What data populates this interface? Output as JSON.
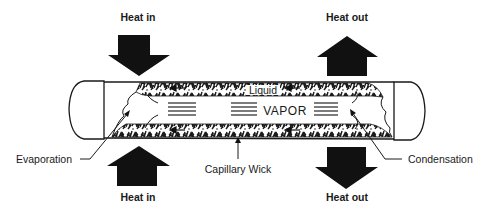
{
  "diagram": {
    "type": "heat-pipe",
    "labels": {
      "heat_in_top": "Heat in",
      "heat_out_top": "Heat out",
      "heat_in_bottom": "Heat in",
      "heat_out_bottom": "Heat out",
      "liquid": "Liquid",
      "vapor": "VAPOR",
      "evaporation": "Evaporation",
      "capillary_wick": "Capillary Wick",
      "condensation": "Condensation"
    },
    "arrows": [
      {
        "id": "heat-in-top",
        "direction": "down",
        "label_ref": "heat_in_top"
      },
      {
        "id": "heat-out-top",
        "direction": "up",
        "label_ref": "heat_out_top"
      },
      {
        "id": "heat-in-bottom",
        "direction": "up",
        "label_ref": "heat_in_bottom"
      },
      {
        "id": "heat-out-bottom",
        "direction": "down",
        "label_ref": "heat_out_bottom"
      }
    ],
    "colors": {
      "ink": "#1a1a1a",
      "background": "#ffffff"
    }
  }
}
